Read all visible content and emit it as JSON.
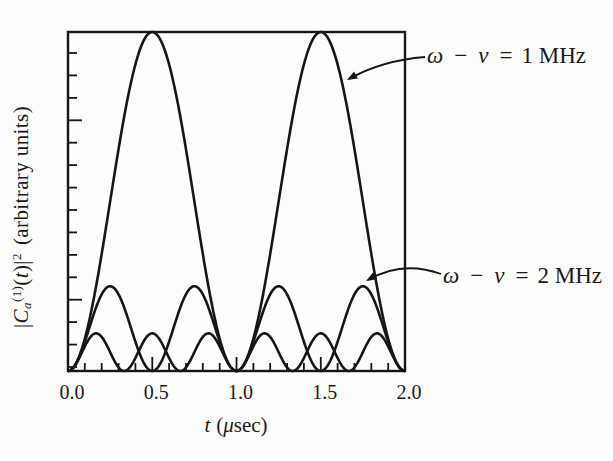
{
  "figure": {
    "background": "#fdfdfc",
    "ink_color": "#161616",
    "y_axis": {
      "full_label": "|Ca(1)(t)|2 (arbitrary units)",
      "label_parts": {
        "bar1": "|",
        "C": "C",
        "sub_a": "a",
        "sup_1": "(1)",
        "p_open": "(",
        "t": "t",
        "p_close": ")",
        "bar2": "|",
        "sup_2": "2",
        "units": "(arbitrary units)"
      }
    },
    "x_axis": {
      "title_var": "t",
      "title_open": "(",
      "title_mu": "μ",
      "title_rest": "sec)",
      "full_title": "t (μsec)"
    },
    "annotations": [
      {
        "lhs": "ω − ν",
        "eq": "=",
        "value": "1 MHz"
      },
      {
        "lhs": "ω − ν",
        "eq": "=",
        "value": "2 MHz"
      }
    ]
  },
  "chart_data": {
    "type": "line",
    "title": "",
    "xlabel": "t (μsec)",
    "ylabel": "|Ca(1)(t)|2 (arbitrary units)",
    "xlim": [
      0,
      2
    ],
    "ylim": [
      0,
      1
    ],
    "grid": false,
    "x_major_ticks": [
      0.0,
      0.5,
      1.0,
      1.5,
      2.0
    ],
    "x_tick_labels": [
      "0.0",
      "0.5",
      "1.0",
      "1.5",
      "2.0"
    ],
    "x_minor_tick_step": 0.1,
    "y_minor_tick_count": 15,
    "series": [
      {
        "name": "detuning-1mhz",
        "label": "ω − ν = 1 MHz",
        "detuning_mhz": 1,
        "amplitude": 1.0,
        "formula": "sin^2(1·π·t)/1^2",
        "peaks_at_t": [
          0.5,
          1.5
        ],
        "zeros_at_t": [
          0,
          1,
          2
        ],
        "labeled": true
      },
      {
        "name": "detuning-2mhz",
        "label": "ω − ν = 2 MHz",
        "detuning_mhz": 2,
        "amplitude": 0.25,
        "formula": "sin^2(2·π·t)/2^2",
        "peaks_at_t": [
          0.25,
          0.75,
          1.25,
          1.75
        ],
        "zeros_at_t": [
          0,
          0.5,
          1,
          1.5,
          2
        ],
        "labeled": true
      },
      {
        "name": "detuning-3mhz",
        "label": "",
        "detuning_mhz": 3,
        "amplitude": 0.111,
        "formula": "sin^2(3·π·t)/3^2",
        "peaks_at_t": [
          0.167,
          0.5,
          0.833,
          1.167,
          1.5,
          1.833
        ],
        "zeros_at_t": [
          0,
          0.333,
          0.667,
          1,
          1.333,
          1.667,
          2
        ],
        "labeled": false
      }
    ],
    "annotations": [
      {
        "text": "ω − ν = 1 MHz",
        "points_to": "right flank of 1 MHz curve second peak near t=1.6"
      },
      {
        "text": "ω − ν = 2 MHz",
        "points_to": "peak of 2 MHz curve at t=1.75"
      }
    ],
    "legend_position": "none"
  }
}
